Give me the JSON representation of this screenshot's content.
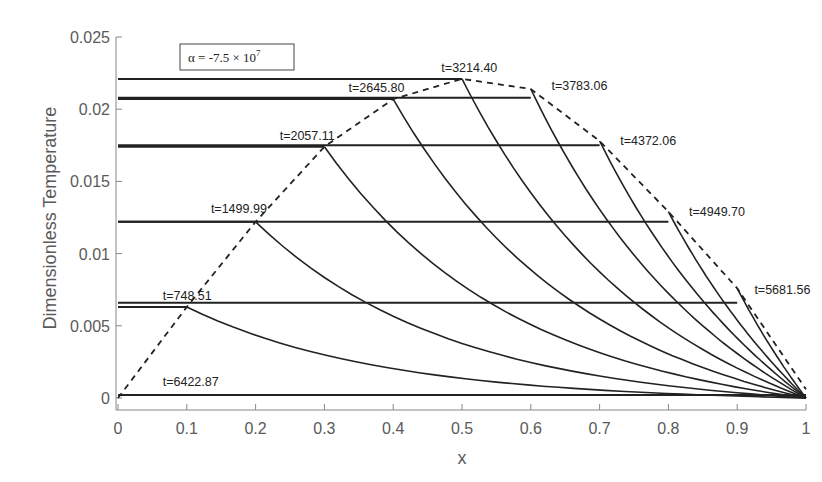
{
  "chart_data": {
    "type": "line",
    "title": "",
    "xlabel": "x",
    "ylabel": "Dimensionless Temperature",
    "xlim": [
      0,
      1
    ],
    "ylim": [
      0,
      0.025
    ],
    "xticks": [
      "0",
      "0.1",
      "0.2",
      "0.3",
      "0.4",
      "0.5",
      "0.6",
      "0.7",
      "0.8",
      "0.9",
      "1"
    ],
    "yticks": [
      "0",
      "0.005",
      "0.01",
      "0.015",
      "0.02",
      "0.025"
    ],
    "grid": false,
    "annotation": "α = -7.5 × 10^7",
    "annotation_parts": {
      "prefix": "α = -7.5 × 10",
      "exponent": "7"
    },
    "envelope": {
      "name": "peak temperature envelope (dashed)",
      "style": "dashed",
      "x": [
        0,
        0.1,
        0.2,
        0.3,
        0.4,
        0.5,
        0.6,
        0.7,
        0.8,
        0.9,
        1.0
      ],
      "y": [
        0,
        0.0063,
        0.0122,
        0.0174,
        0.0207,
        0.0221,
        0.0214,
        0.0178,
        0.0129,
        0.0076,
        0.0006
      ]
    },
    "series": [
      {
        "name": "t=748.51",
        "label": "t=748.51",
        "front_x": 0.1,
        "plateau": 0.0063,
        "label_pos": [
          0.065,
          0.0068
        ]
      },
      {
        "name": "t=1499.99",
        "label": "t=1499.99",
        "front_x": 0.2,
        "plateau": 0.0122,
        "label_pos": [
          0.135,
          0.0128
        ]
      },
      {
        "name": "t=2057.11",
        "label": "t=2057.11",
        "front_x": 0.3,
        "plateau": 0.0174,
        "label_pos": [
          0.235,
          0.0179
        ]
      },
      {
        "name": "t=2645.80",
        "label": "t=2645.80",
        "front_x": 0.4,
        "plateau": 0.0207,
        "label_pos": [
          0.335,
          0.0212
        ]
      },
      {
        "name": "t=3214.40",
        "label": "t=3214.40",
        "front_x": 0.5,
        "plateau": 0.0221,
        "label_pos": [
          0.47,
          0.0226
        ]
      },
      {
        "name": "t=3783.06",
        "label": "t=3783.06",
        "front_x": 0.6,
        "plateau": 0.0208,
        "label_pos": [
          0.63,
          0.0213
        ]
      },
      {
        "name": "t=4372.06",
        "label": "t=4372.06",
        "front_x": 0.7,
        "plateau": 0.0175,
        "label_pos": [
          0.73,
          0.0175
        ]
      },
      {
        "name": "t=4949.70",
        "label": "t=4949.70",
        "front_x": 0.8,
        "plateau": 0.0122,
        "label_pos": [
          0.83,
          0.0126
        ]
      },
      {
        "name": "t=5681.56",
        "label": "t=5681.56",
        "front_x": 0.9,
        "plateau": 0.0066,
        "label_pos": [
          0.925,
          0.0072
        ]
      },
      {
        "name": "t=6422.87",
        "label": "t=6422.87",
        "front_x": 1.0,
        "plateau": 0.0002,
        "label_pos": [
          0.065,
          0.0008
        ]
      }
    ],
    "decay_curves_note": "From each front (front_x, plateau) a decaying curve descends toward (1, 0); additional decaying curves originate from the envelope points.",
    "legend_position": "top-left (annotation box)"
  }
}
